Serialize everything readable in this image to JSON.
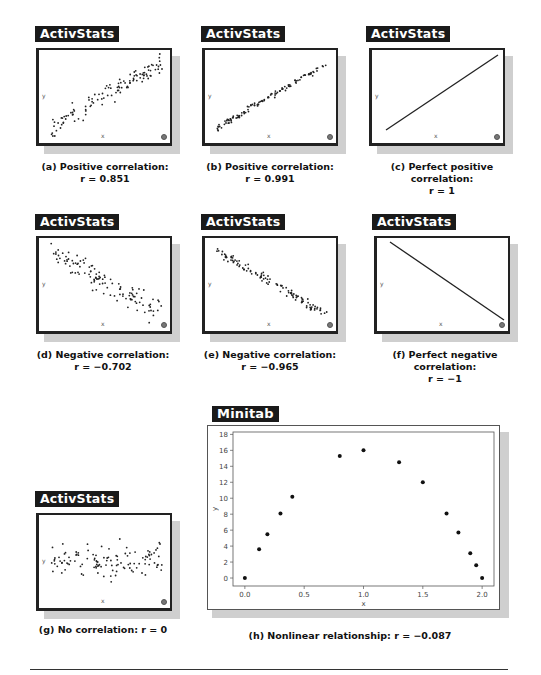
{
  "panels": [
    {
      "id": "a",
      "tag": "ActivStats",
      "caption_line1": "(a) Positive correlation:",
      "caption_r": "r = 0.851",
      "xlabel": "x",
      "ylabel": "y"
    },
    {
      "id": "b",
      "tag": "ActivStats",
      "caption_line1": "(b) Positive correlation:",
      "caption_r": "r = 0.991",
      "xlabel": "x",
      "ylabel": "y"
    },
    {
      "id": "c",
      "tag": "ActivStats",
      "caption_line1": "(c) Perfect positive correlation:",
      "caption_r": "r = 1",
      "xlabel": "x",
      "ylabel": "y"
    },
    {
      "id": "d",
      "tag": "ActivStats",
      "caption_line1": "(d) Negative correlation:",
      "caption_r": "r = −0.702",
      "xlabel": "x",
      "ylabel": "y"
    },
    {
      "id": "e",
      "tag": "ActivStats",
      "caption_line1": "(e) Negative correlation:",
      "caption_r": "r = −0.965",
      "xlabel": "x",
      "ylabel": "y"
    },
    {
      "id": "f",
      "tag": "ActivStats",
      "caption_line1": "(f) Perfect negative correlation:",
      "caption_r": "r = −1",
      "xlabel": "x",
      "ylabel": "y"
    },
    {
      "id": "g",
      "tag": "ActivStats",
      "caption_line1": "(g) No correlation: r = 0",
      "caption_r": "",
      "xlabel": "x",
      "ylabel": "y"
    },
    {
      "id": "h",
      "tag": "Minitab",
      "caption_line1": "(h) Nonlinear relationship: r = −0.087",
      "caption_r": "",
      "xlabel": "x",
      "ylabel": "y"
    }
  ],
  "chart_data": [
    {
      "type": "scatter",
      "title": "(a) Positive correlation",
      "r": 0.851,
      "xlabel": "x",
      "ylabel": "y",
      "trend": "positive",
      "points_approx": 120
    },
    {
      "type": "scatter",
      "title": "(b) Positive correlation",
      "r": 0.991,
      "xlabel": "x",
      "ylabel": "y",
      "trend": "positive",
      "points_approx": 120
    },
    {
      "type": "line",
      "title": "(c) Perfect positive correlation",
      "r": 1,
      "xlabel": "x",
      "ylabel": "y",
      "trend": "positive"
    },
    {
      "type": "scatter",
      "title": "(d) Negative correlation",
      "r": -0.702,
      "xlabel": "x",
      "ylabel": "y",
      "trend": "negative",
      "points_approx": 120
    },
    {
      "type": "scatter",
      "title": "(e) Negative correlation",
      "r": -0.965,
      "xlabel": "x",
      "ylabel": "y",
      "trend": "negative",
      "points_approx": 120
    },
    {
      "type": "line",
      "title": "(f) Perfect negative correlation",
      "r": -1,
      "xlabel": "x",
      "ylabel": "y",
      "trend": "negative"
    },
    {
      "type": "scatter",
      "title": "(g) No correlation",
      "r": 0,
      "xlabel": "x",
      "ylabel": "y",
      "trend": "none",
      "points_approx": 120
    },
    {
      "type": "scatter",
      "title": "(h) Nonlinear relationship",
      "r": -0.087,
      "xlabel": "x",
      "ylabel": "y",
      "x": [
        0.0,
        0.12,
        0.19,
        0.3,
        0.4,
        0.8,
        1.0,
        1.3,
        1.5,
        1.7,
        1.8,
        1.9,
        1.95,
        2.0
      ],
      "y": [
        0.0,
        3.6,
        5.5,
        8.1,
        10.2,
        15.3,
        16.0,
        14.5,
        12.0,
        8.1,
        5.7,
        3.1,
        1.6,
        0.0
      ],
      "xlim": [
        -0.1,
        2.1
      ],
      "ylim": [
        -1,
        18.3
      ],
      "xticks": [
        "0.0",
        "0.5",
        "1.0",
        "1.5",
        "2.0"
      ],
      "yticks": [
        "0",
        "2",
        "4",
        "6",
        "8",
        "10",
        "12",
        "14",
        "16",
        "18"
      ],
      "grid": false
    }
  ]
}
